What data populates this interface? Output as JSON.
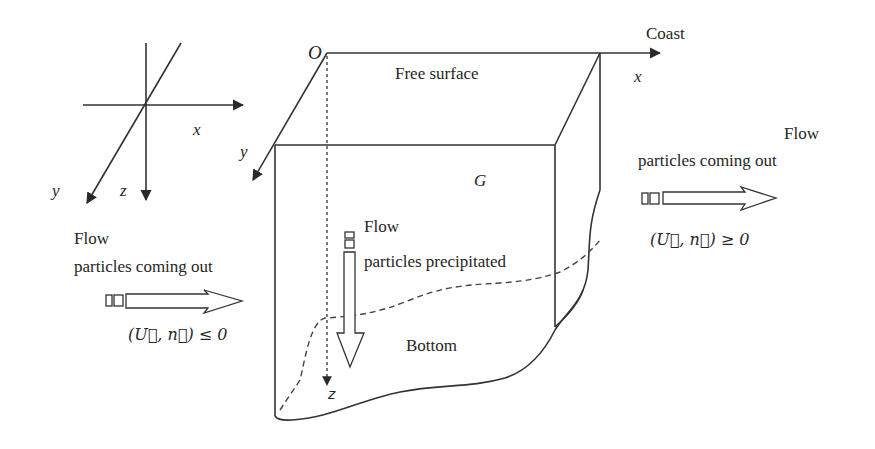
{
  "axes_inset": {
    "x_label": "x",
    "y_label": "y",
    "z_label": "z"
  },
  "domain_box": {
    "origin_label": "O",
    "x_label": "x",
    "y_label": "y",
    "z_label": "z",
    "top_label": "Free surface",
    "domain_label": "G",
    "bottom_label": "Bottom",
    "coast_label": "Coast"
  },
  "inflow_left": {
    "line1": "Flow",
    "line2": "particles coming out",
    "condition": "(U⃗, n⃗) ≤ 0"
  },
  "outflow_right": {
    "line1": "Flow",
    "line2": "particles coming out",
    "condition": "(U⃗, n⃗) ≥ 0"
  },
  "precipitation": {
    "line1": "Flow",
    "line2": "particles precipitated"
  },
  "colors": {
    "line": "#333333",
    "background": "#ffffff"
  }
}
